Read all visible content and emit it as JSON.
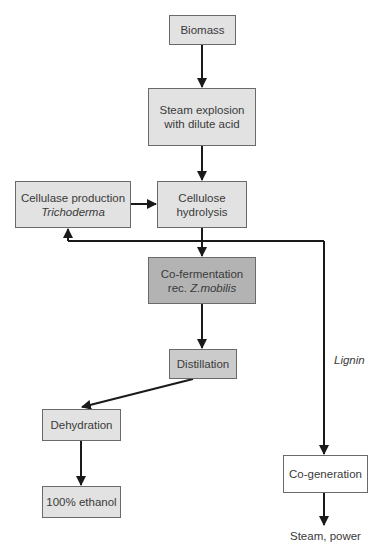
{
  "diagram": {
    "type": "process-flowchart",
    "nodes": [
      {
        "id": "biomass",
        "label": "Biomass"
      },
      {
        "id": "steam_explosion",
        "line1": "Steam explosion",
        "line2": "with dilute acid"
      },
      {
        "id": "cellulase_production",
        "line1": "Cellulase production",
        "line2_italic": "Trichoderma"
      },
      {
        "id": "cellulose_hydrolysis",
        "line1": "Cellulose",
        "line2": "hydrolysis"
      },
      {
        "id": "co_fermentation",
        "line1": "Co-fermentation",
        "line2_prefix": "rec. ",
        "line2_italic": "Z.mobilis"
      },
      {
        "id": "distillation",
        "label": "Distillation"
      },
      {
        "id": "dehydration",
        "label": "Dehydration"
      },
      {
        "id": "ethanol",
        "label": "100% ethanol"
      },
      {
        "id": "co_generation",
        "label": "Co-generation"
      }
    ],
    "edge_labels": {
      "lignin": "Lignin",
      "steam_power": "Steam, power"
    },
    "edges": [
      {
        "from": "biomass",
        "to": "steam_explosion"
      },
      {
        "from": "steam_explosion",
        "to": "cellulose_hydrolysis"
      },
      {
        "from": "cellulase_production",
        "to": "cellulose_hydrolysis"
      },
      {
        "from": "cellulose_hydrolysis",
        "to": "co_fermentation"
      },
      {
        "from": "cellulose_hydrolysis",
        "to": "cellulase_production"
      },
      {
        "from": "cellulose_hydrolysis",
        "to": "co_generation",
        "label": "Lignin"
      },
      {
        "from": "co_fermentation",
        "to": "distillation"
      },
      {
        "from": "distillation",
        "to": "dehydration"
      },
      {
        "from": "dehydration",
        "to": "ethanol"
      },
      {
        "from": "co_generation",
        "to": "steam_power"
      }
    ],
    "colors": {
      "light_box": "#e2e2e2",
      "mid_box": "#cbcbcb",
      "dark_box": "#b3b3b3",
      "white_box": "#ffffff",
      "line": "#1a1a1a"
    }
  }
}
